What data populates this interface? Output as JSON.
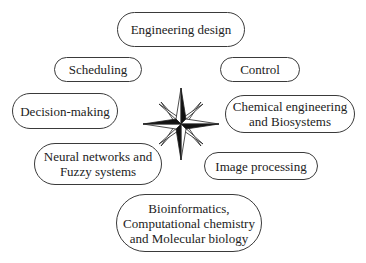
{
  "diagram": {
    "center_icon": "compass-rose-icon",
    "nodes": [
      {
        "id": "engineering-design",
        "lines": [
          "Engineering design"
        ]
      },
      {
        "id": "scheduling",
        "lines": [
          "Scheduling"
        ]
      },
      {
        "id": "control",
        "lines": [
          "Control"
        ]
      },
      {
        "id": "decision-making",
        "lines": [
          "Decision-making"
        ]
      },
      {
        "id": "chemical-engineering",
        "lines": [
          "Chemical engineering",
          "and Biosystems"
        ]
      },
      {
        "id": "neural-networks",
        "lines": [
          "Neural networks and",
          "Fuzzy systems"
        ]
      },
      {
        "id": "image-processing",
        "lines": [
          "Image processing"
        ]
      },
      {
        "id": "bioinformatics",
        "lines": [
          "Bioinformatics,",
          "Computational chemistry",
          "and Molecular biology"
        ]
      }
    ]
  }
}
